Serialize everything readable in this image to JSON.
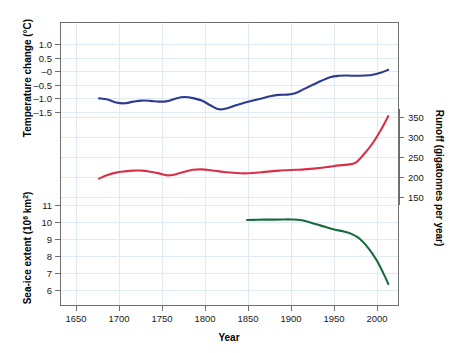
{
  "chart_data": {
    "type": "line",
    "title": "",
    "subtitle": "",
    "xlabel": "Year",
    "xlim": [
      1630,
      2025
    ],
    "xticks": [
      1650,
      1700,
      1750,
      1800,
      1850,
      1900,
      1950,
      2000
    ],
    "grid": true,
    "legend_position": "none",
    "axes": [
      {
        "id": "temperature",
        "side": "left",
        "label": "Temperature change (°C)",
        "ticks": [
          1.0,
          0.5,
          0,
          -0.5,
          -1.0,
          -1.5
        ],
        "tick_labels": [
          "1.0",
          "0.5",
          "–0",
          "–0.5",
          "–1.0",
          "–1.5"
        ],
        "lim": [
          -1.75,
          1.25
        ],
        "units": "°C"
      },
      {
        "id": "runoff",
        "side": "right",
        "label": "Runoff (gigatonnes per year)",
        "ticks": [
          350,
          300,
          250,
          200,
          150
        ],
        "tick_labels": [
          "350",
          "300",
          "250",
          "200",
          "150"
        ],
        "lim": [
          120,
          380
        ],
        "units": "gigatonnes per year"
      },
      {
        "id": "seaice",
        "side": "left",
        "label": "Sea-ice extent (10⁶ km²)",
        "label_base": "Sea-ice extent (10",
        "label_sup": "6",
        "label_tail": " km",
        "label_tail_sup": "2",
        "label_close": ")",
        "ticks": [
          11,
          10,
          9,
          8,
          7,
          6
        ],
        "tick_labels": [
          "11",
          "10",
          "9",
          "8",
          "7",
          "6"
        ],
        "lim": [
          5.3,
          11.6
        ],
        "units": "10^6 km^2"
      }
    ],
    "series": [
      {
        "name": "Temperature change",
        "axis": "temperature",
        "color": "#2c3a92",
        "x": [
          1675,
          1685,
          1695,
          1705,
          1715,
          1725,
          1735,
          1745,
          1755,
          1765,
          1775,
          1785,
          1795,
          1805,
          1815,
          1825,
          1835,
          1845,
          1855,
          1865,
          1875,
          1885,
          1895,
          1905,
          1915,
          1925,
          1935,
          1945,
          1955,
          1965,
          1975,
          1985,
          1995,
          2005,
          2013
        ],
        "y": [
          -1.0,
          -1.04,
          -1.15,
          -1.18,
          -1.12,
          -1.08,
          -1.09,
          -1.12,
          -1.1,
          -1.0,
          -0.95,
          -0.99,
          -1.08,
          -1.25,
          -1.4,
          -1.36,
          -1.25,
          -1.16,
          -1.08,
          -1.0,
          -0.92,
          -0.87,
          -0.86,
          -0.8,
          -0.65,
          -0.5,
          -0.35,
          -0.22,
          -0.17,
          -0.16,
          -0.17,
          -0.16,
          -0.13,
          -0.05,
          0.05
        ]
      },
      {
        "name": "Runoff",
        "axis": "runoff",
        "color": "#d9304a",
        "x": [
          1675,
          1685,
          1695,
          1705,
          1715,
          1725,
          1735,
          1745,
          1755,
          1765,
          1775,
          1785,
          1795,
          1805,
          1815,
          1825,
          1835,
          1845,
          1855,
          1865,
          1875,
          1885,
          1895,
          1905,
          1915,
          1925,
          1935,
          1945,
          1955,
          1965,
          1975,
          1985,
          1995,
          2005,
          2013
        ],
        "y": [
          196,
          205,
          211,
          214,
          216,
          216,
          213,
          209,
          204,
          207,
          213,
          218,
          219,
          217,
          214,
          212,
          210,
          209,
          210,
          212,
          214,
          216,
          217,
          218,
          219,
          221,
          223,
          226,
          229,
          231,
          236,
          258,
          285,
          320,
          352
        ]
      },
      {
        "name": "Sea-ice extent",
        "axis": "seaice",
        "color": "#196b3e",
        "x": [
          1848,
          1860,
          1870,
          1880,
          1890,
          1900,
          1910,
          1920,
          1930,
          1940,
          1950,
          1960,
          1970,
          1980,
          1990,
          2000,
          2010,
          2013
        ],
        "y": [
          10.12,
          10.13,
          10.14,
          10.14,
          10.15,
          10.15,
          10.12,
          10.0,
          9.85,
          9.7,
          9.56,
          9.45,
          9.3,
          9.0,
          8.45,
          7.7,
          6.7,
          6.35
        ]
      }
    ]
  }
}
